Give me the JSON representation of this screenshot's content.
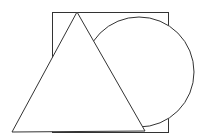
{
  "diagram": {
    "stroke_color": "#333333",
    "background": "#ffffff",
    "shapes": {
      "square": {
        "x": 52,
        "y": 12,
        "width": 116,
        "height": 120
      },
      "circle": {
        "cx": 139,
        "cy": 72,
        "r": 55
      },
      "triangle": {
        "points": "77,12 12,132 145,131"
      }
    }
  }
}
